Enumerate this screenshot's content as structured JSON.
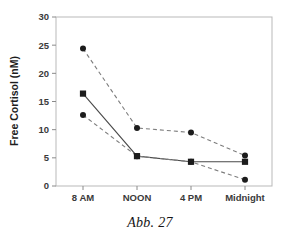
{
  "chart_data": {
    "type": "line",
    "title": "",
    "xlabel": "",
    "ylabel": "Free Cortisol (nM)",
    "categories": [
      "8 AM",
      "NOON",
      "4 PM",
      "Midnight"
    ],
    "ylim": [
      0,
      30
    ],
    "yticks": [
      0,
      5,
      10,
      15,
      20,
      25,
      30
    ],
    "ytick_labels": [
      "0",
      "5",
      "10",
      "15",
      "20",
      "25",
      "30"
    ],
    "grid": false,
    "legend": "none",
    "series": [
      {
        "name": "upper-dashed-circle",
        "marker": "circle",
        "linestyle": "dashed",
        "color": "#1c1c1c",
        "values": [
          24.4,
          10.3,
          9.5,
          5.4
        ]
      },
      {
        "name": "solid-square",
        "marker": "square",
        "linestyle": "solid",
        "color": "#1c1c1c",
        "values": [
          16.4,
          5.3,
          4.3,
          4.3
        ]
      },
      {
        "name": "lower-dashed-circle",
        "marker": "circle",
        "linestyle": "dashed",
        "color": "#1c1c1c",
        "values": [
          12.6,
          5.3,
          4.3,
          1.1
        ]
      }
    ]
  },
  "caption": {
    "text": "Abb. 27"
  },
  "colors": {
    "frame": "#b9b9b9",
    "marker": "#1c1c1c",
    "solid_line": "#4a4a4a",
    "dashed_line": "#7d7d7d",
    "text": "#1d1d1d",
    "background": "#ffffff"
  }
}
